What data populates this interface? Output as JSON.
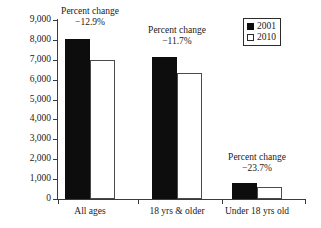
{
  "chart_data": {
    "type": "bar",
    "title": "",
    "subtitle": "",
    "xlabel": "",
    "ylabel": "",
    "categories": [
      "All ages",
      "18 yrs & older",
      "Under 18 yrs old"
    ],
    "series": [
      {
        "name": "2001",
        "values": [
          8050,
          7150,
          780
        ],
        "color": "#0d0d0d"
      },
      {
        "name": "2010",
        "values": [
          7000,
          6350,
          595
        ],
        "color": "#ffffff"
      }
    ],
    "ylim": [
      0,
      9000
    ],
    "yticks": [
      0,
      1000,
      2000,
      3000,
      4000,
      5000,
      6000,
      7000,
      8000,
      9000
    ],
    "ytick_labels": [
      "0",
      "1,000",
      "2,000",
      "3,000",
      "4,000",
      "5,000",
      "6,000",
      "7,000",
      "8,000",
      "9,000"
    ],
    "grid": false,
    "legend_position": "top-right",
    "annotations": [
      {
        "category": "All ages",
        "line1": "Percent change",
        "line2": "−12.9%"
      },
      {
        "category": "18 yrs & older",
        "line1": "Percent change",
        "line2": "−11.7%"
      },
      {
        "category": "Under 18 yrs old",
        "line1": "Percent change",
        "line2": "−23.7%"
      }
    ]
  },
  "legend": {
    "items": [
      {
        "label": "2001",
        "swatch": "filled-black-square"
      },
      {
        "label": "2010",
        "swatch": "open-white-square"
      }
    ]
  },
  "axis": {
    "y_labels": [
      "9,000",
      "8,000",
      "7,000",
      "6,000",
      "5,000",
      "4,000",
      "3,000",
      "2,000",
      "1,000",
      "0"
    ],
    "x_labels": [
      "All ages",
      "18 yrs & older",
      "Under 18 yrs old"
    ]
  },
  "colors": {
    "series_2001": "#0d0d0d",
    "series_2010": "#ffffff",
    "axis": "#3a3a3a",
    "text": "#1a1a1a",
    "background": "#ffffff"
  }
}
